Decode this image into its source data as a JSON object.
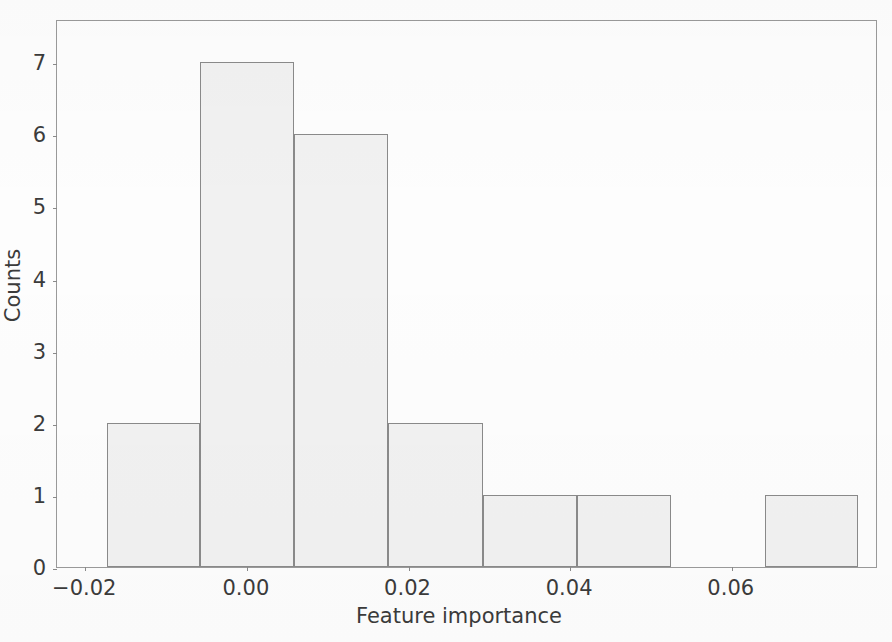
{
  "chart_data": {
    "type": "bar",
    "title": "",
    "subtitle": "",
    "xlabel": "Feature importance",
    "ylabel": "Counts",
    "grid": false,
    "legend": false,
    "legend_position": "none",
    "xlim": [
      -0.0235,
      0.0781
    ],
    "ylim": [
      0,
      7.6
    ],
    "xtick_labels": [
      "−0.02",
      "0.00",
      "0.02",
      "0.04",
      "0.06"
    ],
    "xtick_values": [
      -0.02,
      0.0,
      0.02,
      0.04,
      0.06
    ],
    "ytick_labels": [
      "0",
      "1",
      "2",
      "3",
      "4",
      "5",
      "6",
      "7"
    ],
    "ytick_values": [
      0,
      1,
      2,
      3,
      4,
      5,
      6,
      7
    ],
    "bin_edges": [
      -0.0173,
      -0.0058,
      0.0058,
      0.0175,
      0.0292,
      0.0408,
      0.0525,
      0.0641,
      0.0756
    ],
    "bin_width": 0.0116,
    "categories": [
      "-0.0173 to -0.0058",
      "-0.0058 to 0.0058",
      "0.0058 to 0.0175",
      "0.0175 to 0.0292",
      "0.0292 to 0.0408",
      "0.0408 to 0.0525",
      "0.0525 to 0.0641",
      "0.0641 to 0.0756"
    ],
    "values": [
      2,
      7,
      6,
      2,
      1,
      1,
      0,
      1
    ],
    "bar_fill_color": "#f1f1f1",
    "bar_edge_color": "#8a8a8a",
    "axis_color": "#9a9a9a",
    "text_color": "#3b3b3b",
    "background_color": "#fdfdfd"
  }
}
